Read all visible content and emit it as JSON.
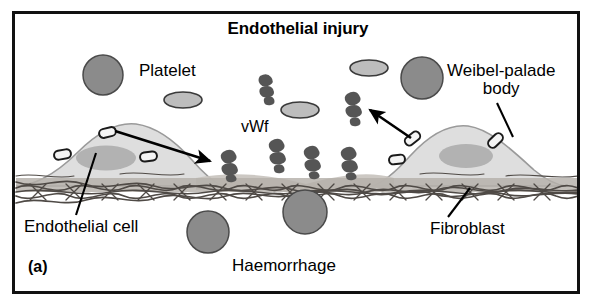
{
  "figure": {
    "panel_letter": "(a)",
    "title": "Endothelial injury",
    "domain": "biomedical-diagram"
  },
  "labels": {
    "title": "Endothelial injury",
    "platelet": "Platelet",
    "vwf": "vWf",
    "weibel_palade_line1": "Weibel-palade",
    "weibel_palade_line2": "body",
    "endothelial_cell": "Endothelial cell",
    "fibroblast": "Fibroblast",
    "haemorrhage": "Haemorrhage",
    "panel_letter": "(a)"
  },
  "colors": {
    "frame": "#111111",
    "background": "#ffffff",
    "endothelial_cell_fill": "#dedede",
    "endothelial_cell_stroke": "#8a8a8a",
    "nucleus_fill": "#b0b0b0",
    "wpb_rod_fill": "#f2f2f2",
    "wpb_rod_stroke": "#1a1a1a",
    "wpb_circle_fill": "#8b8b8b",
    "wpb_circle_stroke": "#4a4a4a",
    "platelet_fill": "#bdbdbd",
    "platelet_stroke": "#3a3a3a",
    "vwf_multimer": "#555555",
    "rbc_fill": "#8b8b8b",
    "rbc_stroke": "#4a4a4a",
    "collagen_stroke": "#4f4a46",
    "subendothelial_band": "#b4b0aa",
    "arrow": "#000000",
    "text": "#000000"
  },
  "elements": {
    "weibel_palade_circles": [
      {
        "id": "wpb-circle-left",
        "cx": 103,
        "cy": 75,
        "r": 20
      },
      {
        "id": "wpb-circle-right",
        "cx": 422,
        "cy": 78,
        "r": 21
      }
    ],
    "platelets": [
      {
        "id": "platelet-1",
        "cx": 183,
        "cy": 100,
        "rx": 19,
        "ry": 8
      },
      {
        "id": "platelet-2",
        "cx": 300,
        "cy": 110,
        "rx": 19,
        "ry": 8
      },
      {
        "id": "platelet-3",
        "cx": 369,
        "cy": 68,
        "rx": 19,
        "ry": 8
      }
    ],
    "vwf_multimers_free": [
      {
        "id": "vwf-free-1",
        "cx": 264,
        "cy": 85
      },
      {
        "id": "vwf-free-2",
        "cx": 353,
        "cy": 104
      }
    ],
    "vwf_multimers_bound": [
      {
        "id": "vwf-bound-1",
        "cx": 228,
        "cy": 163
      },
      {
        "id": "vwf-bound-2",
        "cx": 276,
        "cy": 152
      },
      {
        "id": "vwf-bound-3",
        "cx": 311,
        "cy": 159
      },
      {
        "id": "vwf-bound-4",
        "cx": 348,
        "cy": 160
      }
    ],
    "red_blood_cells": [
      {
        "id": "rbc-1",
        "cx": 208,
        "cy": 232,
        "r": 21
      },
      {
        "id": "rbc-2",
        "cx": 305,
        "cy": 212,
        "r": 22
      }
    ],
    "endothelial_cells": [
      {
        "id": "endothelial-cell-left",
        "side": "left"
      },
      {
        "id": "endothelial-cell-right",
        "side": "right"
      }
    ],
    "arrows": [
      {
        "id": "arrow-secretion-left",
        "from": "wpb-rod-left-top",
        "to": "vwf-bound-1"
      },
      {
        "id": "arrow-secretion-right",
        "from": "wpb-rod-right-outer",
        "to": "vwf-free-2"
      }
    ],
    "leader_lines": [
      {
        "id": "leader-endothelial-cell",
        "label": "endothelial_cell"
      },
      {
        "id": "leader-fibroblast",
        "label": "fibroblast"
      },
      {
        "id": "leader-weibel-palade-body",
        "label": "weibel_palade_body"
      }
    ]
  }
}
